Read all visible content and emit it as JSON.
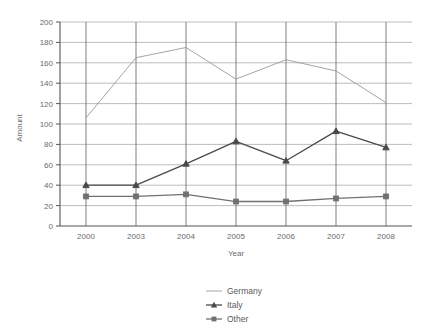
{
  "chart_data": {
    "type": "line",
    "title": "",
    "xlabel": "Year",
    "ylabel": "Amount",
    "categories": [
      "2000",
      "2003",
      "2004",
      "2005",
      "2006",
      "2007",
      "2008"
    ],
    "series": [
      {
        "name": "Germany",
        "values": [
          106,
          165,
          175,
          144,
          163,
          152,
          121
        ],
        "color": "#9a9a9a",
        "marker": "none"
      },
      {
        "name": "Italy",
        "values": [
          40,
          40,
          61,
          83,
          64,
          93,
          77
        ],
        "color": "#4a4a4a",
        "marker": "triangle"
      },
      {
        "name": "Other",
        "values": [
          29,
          29,
          31,
          24,
          24,
          27,
          29
        ],
        "color": "#707070",
        "marker": "square"
      }
    ],
    "ylim": [
      0,
      200
    ],
    "ytick_step": 20,
    "yticks": [
      "0",
      "20",
      "40",
      "60",
      "80",
      "100",
      "120",
      "140",
      "160",
      "180",
      "200"
    ],
    "grid": {
      "horizontal": true,
      "vertical": true,
      "color": "#b5b5b5"
    },
    "legend": {
      "position": "bottom-center",
      "entries": [
        "Germany",
        "Italy",
        "Other"
      ]
    },
    "axis_color": "#555555",
    "background": "#ffffff"
  },
  "labels": {
    "y_axis_title": "Amount",
    "x_axis_title": "Year"
  }
}
